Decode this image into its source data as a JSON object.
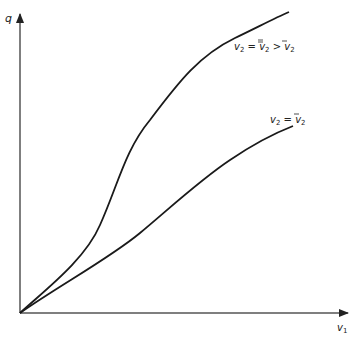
{
  "axes": {
    "y_label": "q",
    "x_label": "v",
    "x_label_sub": "1"
  },
  "curves": [
    {
      "id": "upper",
      "label_parts": [
        "v",
        "2",
        " = ",
        "v",
        "2",
        " > ",
        "v",
        "2"
      ],
      "label_text": "v2 = v̿2 > v̄2",
      "path": "M20,313 C45,290 85,260 100,225 C118,185 125,150 150,120 C180,80 200,55 235,38 C258,27 275,18 289,12"
    },
    {
      "id": "lower",
      "label_text": "v2 = v̄2",
      "path": "M20,313 C60,285 110,258 140,233 C170,208 200,180 230,160 C255,143 275,133 293,126"
    }
  ],
  "colors": {
    "axis": "#444444",
    "curve": "#1a1a1a",
    "text": "#222222"
  }
}
